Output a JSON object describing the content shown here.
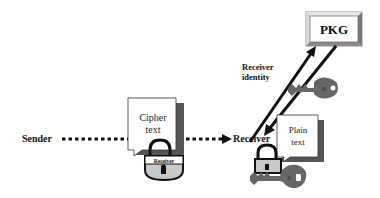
{
  "diagram": {
    "nodes": {
      "pkg": {
        "label": "PKG"
      },
      "sender": {
        "label": "Sender"
      },
      "receiver": {
        "label": "Receiver"
      },
      "cipher_doc": {
        "line1": "Cipher",
        "line2": "text"
      },
      "plain_doc": {
        "line1": "Plain",
        "line2": "text"
      },
      "lock_label": "Receiver",
      "key_glyph": "S"
    },
    "edges": {
      "receiver_identity": {
        "line1": "Receiver",
        "line2": "identity"
      }
    },
    "colors": {
      "ink": "#111111",
      "key_gray": "#666666",
      "lock_fill": "#c8c8c8",
      "shadow": "#555555",
      "pkg_border": "#999999"
    }
  }
}
